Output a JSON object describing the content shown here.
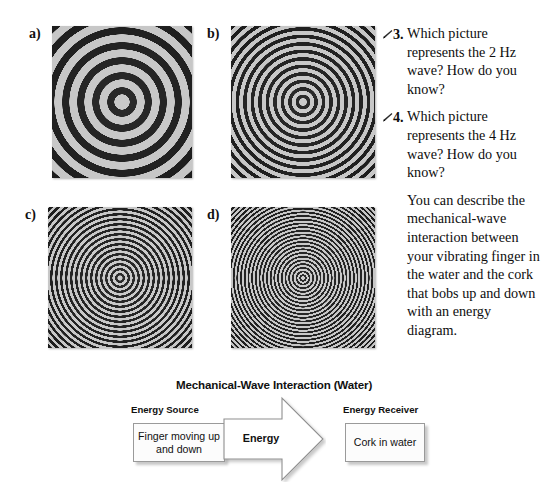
{
  "figure": {
    "panels": [
      {
        "label": "a)",
        "ring_count": 13,
        "ring_spacing_px": 15,
        "description": "widely spaced concentric water ripple rings"
      },
      {
        "label": "b)",
        "ring_count": 26,
        "ring_spacing_px": 7.5,
        "description": "concentric water ripple rings twice as dense as panel a"
      },
      {
        "label": "c)",
        "ring_count": 39,
        "ring_spacing_px": 5,
        "description": "closely spaced concentric water ripple rings"
      },
      {
        "label": "d)",
        "ring_count": 52,
        "ring_spacing_px": 3.7,
        "description": "most densely spaced concentric water ripple rings"
      }
    ]
  },
  "questions": {
    "items": [
      {
        "number": "3.",
        "icon": "pencil-icon",
        "text": "Which picture represents the 2 Hz wave? How do you know?"
      },
      {
        "number": "4.",
        "icon": "pencil-icon",
        "text": "Which picture represents the 4 Hz wave? How do you know?"
      }
    ],
    "body_paragraph": "You can describe the mechanical-wave interaction between your vibrating finger in the water and the cork that bobs up and down with an energy diagram."
  },
  "energy_diagram": {
    "title": "Mechanical-Wave Interaction (Water)",
    "source_caption": "Energy Source",
    "source_box": "Finger moving up and down",
    "arrow_label": "Energy",
    "receiver_caption": "Energy Receiver",
    "receiver_box": "Cork in water"
  },
  "colors": {
    "page_background": "#ffffff",
    "text": "#101010",
    "ripple_light": "#c6c6c6",
    "ripple_dark": "#1b1b1b",
    "box_fill": "#fcfcfc",
    "box_border": "#9a9a9a",
    "arrow_fill": "#ffffff",
    "arrow_border": "#8f8f8f"
  }
}
